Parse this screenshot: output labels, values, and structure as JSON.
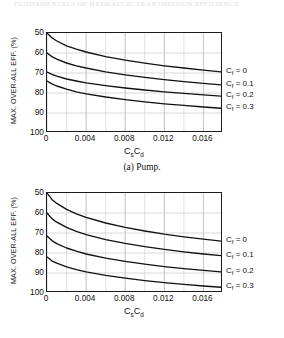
{
  "running_header": {
    "text": "FUNDAMENTALS OF HYDRAULIC TRANSMISSION EFFICIENCY"
  },
  "figure_a": {
    "caption": "(a)  Pump.",
    "ylabel": "MAX. OVER-ALL EFF. (%)",
    "xlabel_main": "C",
    "xlabel_sub1": "s",
    "xlabel_main2": "C",
    "xlabel_sub2": "d",
    "yticks": [
      "100",
      "90",
      "80",
      "70",
      "60",
      "50"
    ],
    "xticks": [
      "0",
      "0.004",
      "0.008",
      "0.012",
      "0.016"
    ],
    "legend": [
      {
        "symbol": "C",
        "sub": "f",
        "eq": " = 0"
      },
      {
        "symbol": "C",
        "sub": "f",
        "eq": " = 0.1"
      },
      {
        "symbol": "C",
        "sub": "f",
        "eq": " = 0.2"
      },
      {
        "symbol": "C",
        "sub": "f",
        "eq": " = 0.3"
      }
    ]
  },
  "figure_b": {
    "caption": "(b)  Motor.",
    "ylabel": "MAX. OVER-ALL  EFF. (%)",
    "xlabel_main": "C",
    "xlabel_sub1": "s",
    "xlabel_main2": "C",
    "xlabel_sub2": "d",
    "yticks": [
      "100",
      "90",
      "80",
      "70",
      "60",
      "50"
    ],
    "xticks": [
      "0",
      "0.004",
      "0.008",
      "0.012",
      "0.016"
    ],
    "legend": [
      {
        "symbol": "C",
        "sub": "f",
        "eq": " = 0"
      },
      {
        "symbol": "C",
        "sub": "f",
        "eq": " = 0.1"
      },
      {
        "symbol": "C",
        "sub": "f",
        "eq": " = 0.2"
      },
      {
        "symbol": "C",
        "sub": "f",
        "eq": " = 0.3"
      }
    ]
  },
  "chart_data": [
    {
      "type": "line",
      "title": "(a) Pump.",
      "xlabel": "Cs Cd",
      "ylabel": "MAX. OVER-ALL EFF. (%)",
      "xlim": [
        0,
        0.018
      ],
      "ylim": [
        50,
        100
      ],
      "xticks": [
        0,
        0.004,
        0.008,
        0.012,
        0.016
      ],
      "yticks": [
        50,
        60,
        70,
        80,
        90,
        100
      ],
      "grid": true,
      "legend_position": "right-outside",
      "x": [
        0,
        0.0005,
        0.001,
        0.002,
        0.003,
        0.004,
        0.006,
        0.008,
        0.01,
        0.012,
        0.014,
        0.016,
        0.018
      ],
      "series": [
        {
          "name": "Cf = 0",
          "values": [
            100.0,
            97.6,
            96.0,
            93.6,
            91.9,
            90.5,
            88.2,
            86.4,
            84.9,
            83.6,
            82.5,
            81.4,
            80.5
          ]
        },
        {
          "name": "Cf = 0.1",
          "values": [
            90.0,
            88.2,
            86.9,
            85.0,
            83.6,
            82.5,
            80.6,
            79.1,
            77.8,
            76.7,
            75.7,
            74.8,
            74.0
          ]
        },
        {
          "name": "Cf = 0.2",
          "values": [
            80.5,
            79.3,
            78.4,
            77.0,
            76.0,
            75.1,
            73.7,
            72.5,
            71.5,
            70.6,
            69.8,
            69.1,
            68.4
          ]
        },
        {
          "name": "Cf = 0.3",
          "values": [
            76.0,
            74.6,
            73.5,
            71.9,
            70.6,
            69.6,
            68.0,
            66.7,
            65.6,
            64.6,
            63.8,
            63.0,
            62.3
          ]
        }
      ]
    },
    {
      "type": "line",
      "title": "(b) Motor.",
      "xlabel": "Cs Cd",
      "ylabel": "MAX. OVER-ALL EFF. (%)",
      "xlim": [
        0,
        0.018
      ],
      "ylim": [
        50,
        100
      ],
      "xticks": [
        0,
        0.004,
        0.008,
        0.012,
        0.016
      ],
      "yticks": [
        50,
        60,
        70,
        80,
        90,
        100
      ],
      "grid": true,
      "legend_position": "right-outside",
      "x": [
        0,
        0.0005,
        0.001,
        0.002,
        0.003,
        0.004,
        0.006,
        0.008,
        0.01,
        0.012,
        0.014,
        0.016,
        0.018
      ],
      "series": [
        {
          "name": "Cf = 0",
          "values": [
            100.0,
            96.8,
            94.8,
            91.8,
            89.6,
            87.8,
            85.0,
            82.8,
            81.0,
            79.4,
            78.1,
            76.9,
            75.8
          ]
        },
        {
          "name": "Cf = 0.1",
          "values": [
            90.0,
            87.2,
            85.4,
            82.8,
            80.8,
            79.2,
            76.7,
            74.8,
            73.2,
            71.8,
            70.6,
            69.5,
            68.6
          ]
        },
        {
          "name": "Cf = 0.2",
          "values": [
            78.5,
            76.2,
            74.7,
            72.5,
            70.9,
            69.5,
            67.4,
            65.8,
            64.4,
            63.2,
            62.2,
            61.3,
            60.5
          ]
        },
        {
          "name": "Cf = 0.3",
          "values": [
            68.0,
            66.1,
            64.9,
            63.1,
            61.7,
            60.6,
            58.8,
            57.4,
            56.2,
            55.2,
            54.3,
            53.5,
            52.8
          ]
        }
      ]
    }
  ]
}
